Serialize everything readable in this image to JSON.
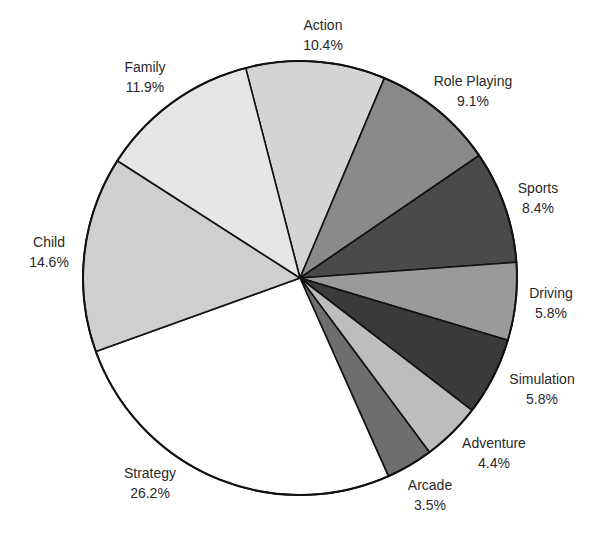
{
  "chart_data": {
    "type": "pie",
    "title": "",
    "start_angle_deg": -14.5,
    "direction": "clockwise",
    "center": [
      300,
      278
    ],
    "radius": 217,
    "slices": [
      {
        "label": "Action",
        "value": 10.4,
        "display": "10.4%",
        "color": "#d4d4d4",
        "label_pos": [
          323,
          30
        ]
      },
      {
        "label": "Role Playing",
        "value": 9.1,
        "display": "9.1%",
        "color": "#8a8a8a",
        "label_pos": [
          473,
          86
        ]
      },
      {
        "label": "Sports",
        "value": 8.4,
        "display": "8.4%",
        "color": "#4a4a4a",
        "label_pos": [
          538,
          193
        ]
      },
      {
        "label": "Driving",
        "value": 5.8,
        "display": "5.8%",
        "color": "#9a9a9a",
        "label_pos": [
          551,
          298
        ]
      },
      {
        "label": "Simulation",
        "value": 5.8,
        "display": "5.8%",
        "color": "#3a3a3a",
        "label_pos": [
          542,
          384
        ]
      },
      {
        "label": "Adventure",
        "value": 4.4,
        "display": "4.4%",
        "color": "#bdbdbd",
        "label_pos": [
          494,
          448
        ]
      },
      {
        "label": "Arcade",
        "value": 3.5,
        "display": "3.5%",
        "color": "#6e6e6e",
        "label_pos": [
          430,
          490
        ]
      },
      {
        "label": "Strategy",
        "value": 26.2,
        "display": "26.2%",
        "color": "#ffffff",
        "label_pos": [
          150,
          478
        ]
      },
      {
        "label": "Child",
        "value": 14.6,
        "display": "14.6%",
        "color": "#cfcfcf",
        "label_pos": [
          49,
          247
        ]
      },
      {
        "label": "Family",
        "value": 11.9,
        "display": "11.9%",
        "color": "#e6e6e6",
        "label_pos": [
          145,
          72
        ]
      }
    ]
  }
}
